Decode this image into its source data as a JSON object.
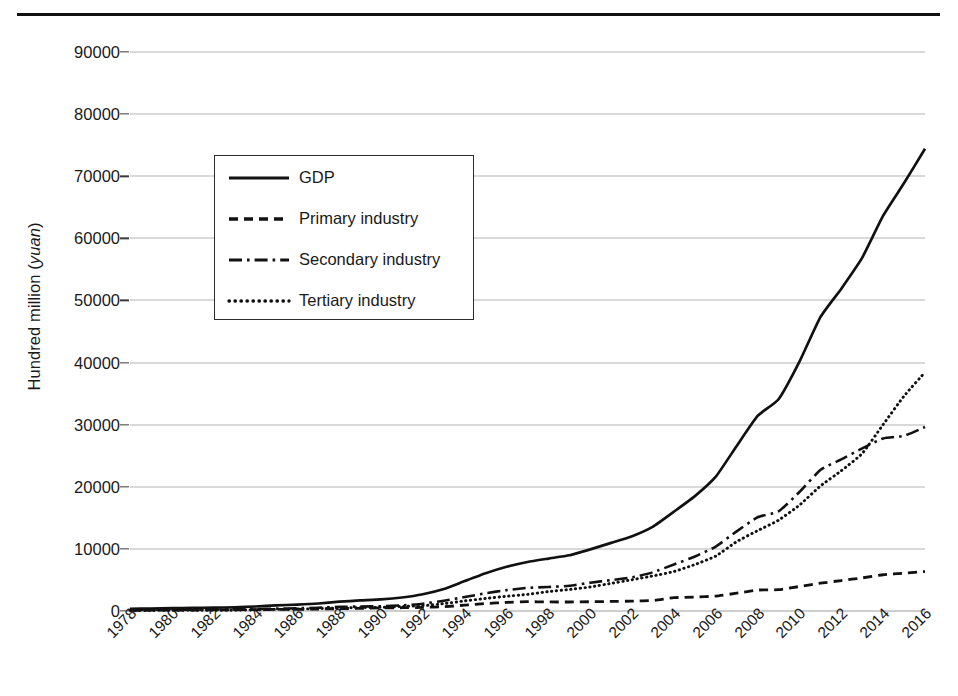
{
  "chart_data": {
    "type": "line",
    "title": "",
    "xlabel": "",
    "ylabel": "Hundred million (yuan)",
    "ylabel_plain": "Hundred million (",
    "ylabel_italic": "yuan",
    "ylabel_tail": ")",
    "ylim": [
      0,
      90000
    ],
    "ytick_labels": [
      "90000",
      "80000",
      "70000",
      "60000",
      "50000",
      "40000",
      "30000",
      "20000",
      "10000",
      "0"
    ],
    "ytick_values": [
      90000,
      80000,
      70000,
      60000,
      50000,
      40000,
      30000,
      20000,
      10000,
      0
    ],
    "grid": true,
    "legend_position": "upper-left-inside",
    "xlim": [
      1978,
      2016
    ],
    "tick_labels": [
      "1978",
      "1980",
      "1982",
      "1984",
      "1986",
      "1988",
      "1990",
      "1992",
      "1994",
      "1996",
      "1998",
      "2000",
      "2002",
      "2004",
      "2006",
      "2008",
      "2010",
      "2012",
      "2014",
      "2016"
    ],
    "x": [
      1978,
      1979,
      1980,
      1981,
      1982,
      1983,
      1984,
      1985,
      1986,
      1987,
      1988,
      1989,
      1990,
      1991,
      1992,
      1993,
      1994,
      1995,
      1996,
      1997,
      1998,
      1999,
      2000,
      2001,
      2002,
      2003,
      2004,
      2005,
      2006,
      2007,
      2008,
      2009,
      2010,
      2011,
      2012,
      2013,
      2014,
      2015,
      2016
    ],
    "series": [
      {
        "name": "GDP",
        "style": "solid",
        "color": "#111111",
        "values": [
          3645,
          4063,
          4546,
          4892,
          5323,
          5963,
          7208,
          9016,
          10275,
          12059,
          15043,
          16992,
          18668,
          21781,
          26923,
          35334,
          48198,
          60794,
          71177,
          78973,
          84402,
          89677,
          99215,
          109655,
          120333,
          135823,
          159878,
          184937,
          216314,
          265810,
          314045,
          340903,
          401513,
          473104,
          518942,
          568845,
          636463,
          689052,
          744127
        ],
        "plot_values_hundred_million": [
          365,
          406,
          455,
          489,
          532,
          596,
          721,
          902,
          1028,
          1206,
          1504,
          1699,
          1867,
          2178,
          2692,
          3533,
          4820,
          6079,
          7118,
          7897,
          8440,
          8968,
          9921,
          10966,
          12033,
          13582,
          15988,
          18494,
          21631,
          26581,
          31405,
          34090,
          40151,
          47310,
          51894,
          56885,
          63646,
          68905,
          74413
        ]
      },
      {
        "name": "Primary industry",
        "style": "dashed",
        "color": "#111111",
        "plot_values_hundred_million": [
          102,
          126,
          136,
          155,
          178,
          197,
          229,
          254,
          276,
          304,
          383,
          423,
          502,
          529,
          580,
          688,
          947,
          1199,
          1385,
          1496,
          1455,
          1447,
          1494,
          1540,
          1594,
          1691,
          2141,
          2242,
          2404,
          2863,
          3370,
          3426,
          3943,
          4478,
          4902,
          5332,
          5834,
          6086,
          6354
        ]
      },
      {
        "name": "Secondary industry",
        "style": "dashdot",
        "color": "#111111",
        "plot_values_hundred_million": [
          174,
          191,
          219,
          226,
          238,
          265,
          312,
          387,
          441,
          526,
          658,
          728,
          772,
          911,
          1170,
          1650,
          2247,
          2854,
          3361,
          3722,
          3861,
          4055,
          4556,
          4980,
          5405,
          6243,
          7490,
          8770,
          10382,
          12831,
          15095,
          16040,
          19162,
          22714,
          24402,
          26181,
          27782,
          28207,
          29624
        ]
      },
      {
        "name": "Tertiary industry",
        "style": "dotted",
        "color": "#111111",
        "plot_values_hundred_million": [
          89,
          90,
          100,
          108,
          116,
          134,
          180,
          261,
          311,
          376,
          463,
          548,
          593,
          738,
          842,
          1195,
          1626,
          2026,
          2372,
          2679,
          3124,
          3466,
          3871,
          4446,
          5034,
          5648,
          6357,
          7482,
          8847,
          11169,
          12940,
          14624,
          17046,
          20118,
          22590,
          25372,
          30030,
          34612,
          38435
        ]
      }
    ],
    "legend_entries": [
      {
        "label": "GDP",
        "style": "solid"
      },
      {
        "label": "Primary industry",
        "style": "dashed"
      },
      {
        "label": "Secondary industry",
        "style": "dashdot"
      },
      {
        "label": "Tertiary industry",
        "style": "dotted"
      }
    ]
  }
}
